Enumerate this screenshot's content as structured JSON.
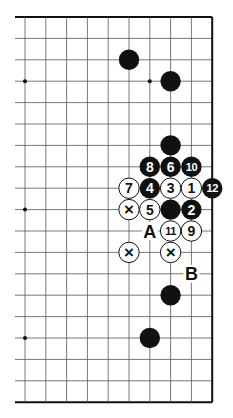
{
  "diagram": {
    "type": "go-board-fragment",
    "grid": {
      "columns": 10,
      "rows": 19,
      "x0": 25,
      "dx": 20.8,
      "y0": 17,
      "dy": 21.4,
      "left_fade_x": 15,
      "top_edge": true,
      "right_edge": true,
      "bottom_edge": true
    },
    "star_points": [
      {
        "col": 0,
        "row": 3
      },
      {
        "col": 6,
        "row": 3
      },
      {
        "col": 0,
        "row": 9
      },
      {
        "col": 0,
        "row": 15
      }
    ],
    "stones": [
      {
        "col": 5,
        "row": 2,
        "color": "black",
        "label": ""
      },
      {
        "col": 7,
        "row": 3,
        "color": "black",
        "label": ""
      },
      {
        "col": 7,
        "row": 6,
        "color": "black",
        "label": ""
      },
      {
        "col": 6,
        "row": 7,
        "color": "black",
        "label": "8"
      },
      {
        "col": 7,
        "row": 7,
        "color": "black",
        "label": "6"
      },
      {
        "col": 8,
        "row": 7,
        "color": "black",
        "label": "10"
      },
      {
        "col": 5,
        "row": 8,
        "color": "white",
        "label": "7"
      },
      {
        "col": 6,
        "row": 8,
        "color": "black",
        "label": "4"
      },
      {
        "col": 7,
        "row": 8,
        "color": "white",
        "label": "3"
      },
      {
        "col": 8,
        "row": 8,
        "color": "white",
        "label": "1"
      },
      {
        "col": 9,
        "row": 8,
        "color": "black",
        "label": "12"
      },
      {
        "col": 5,
        "row": 9,
        "color": "white",
        "label": "×"
      },
      {
        "col": 6,
        "row": 9,
        "color": "white",
        "label": "5"
      },
      {
        "col": 7,
        "row": 9,
        "color": "black",
        "label": ""
      },
      {
        "col": 8,
        "row": 9,
        "color": "black",
        "label": "2"
      },
      {
        "col": 7,
        "row": 10,
        "color": "white",
        "label": "11"
      },
      {
        "col": 8,
        "row": 10,
        "color": "white",
        "label": "9"
      },
      {
        "col": 5,
        "row": 11,
        "color": "white",
        "label": "×"
      },
      {
        "col": 7,
        "row": 11,
        "color": "white",
        "label": "×"
      },
      {
        "col": 7,
        "row": 13,
        "color": "black",
        "label": ""
      },
      {
        "col": 6,
        "row": 15,
        "color": "black",
        "label": ""
      }
    ],
    "point_labels": [
      {
        "col": 6,
        "row": 10,
        "text": "A"
      },
      {
        "col": 8,
        "row": 12,
        "text": "B"
      }
    ],
    "colors": {
      "line": "#555555",
      "edge": "#111111",
      "black_stone": "#111111",
      "white_stone": "#ffffff",
      "white_label": "#ffffff",
      "black_label": "#111111"
    }
  }
}
